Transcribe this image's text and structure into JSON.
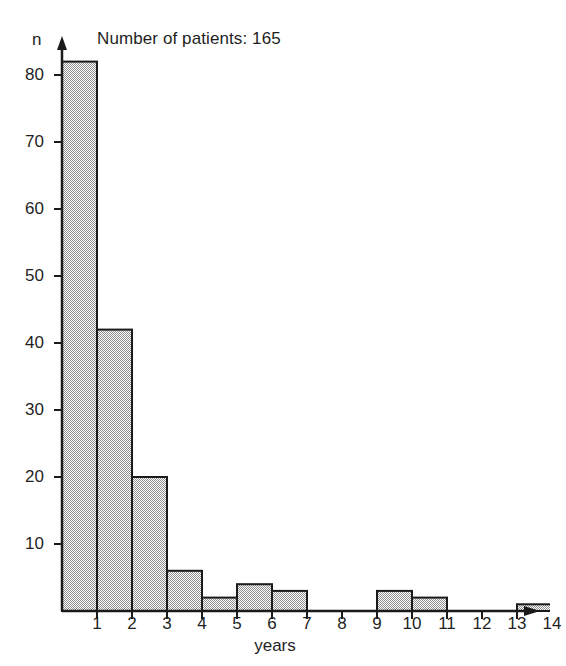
{
  "chart_data": {
    "type": "bar",
    "title": "Number of patients: 165",
    "xlabel": "years",
    "ylabel": "n",
    "categories": [
      "0-1",
      "1-2",
      "2-3",
      "3-4",
      "4-5",
      "5-6",
      "6-7",
      "7-8",
      "8-9",
      "9-10",
      "10-11",
      "11-12",
      "12-13",
      "13-14"
    ],
    "values": [
      82,
      42,
      20,
      6,
      2,
      4,
      3,
      0,
      0,
      3,
      2,
      0,
      0,
      1
    ],
    "x_tick_labels": [
      "1",
      "2",
      "3",
      "4",
      "5",
      "6",
      "7",
      "8",
      "9",
      "10",
      "11",
      "12",
      "13",
      "14"
    ],
    "y_tick_labels": [
      "10",
      "20",
      "30",
      "40",
      "50",
      "60",
      "70",
      "80"
    ],
    "y_tick_values": [
      10,
      20,
      30,
      40,
      50,
      60,
      70,
      80
    ],
    "xlim": [
      0,
      14
    ],
    "ylim": [
      0,
      86
    ],
    "grid": false,
    "legend": null,
    "bar_fill_color": "#cfcfcf",
    "bar_edge_color": "#1a1a1a",
    "axis_color": "#1a1a1a",
    "background_color": "#ffffff",
    "total_patients": 165
  }
}
